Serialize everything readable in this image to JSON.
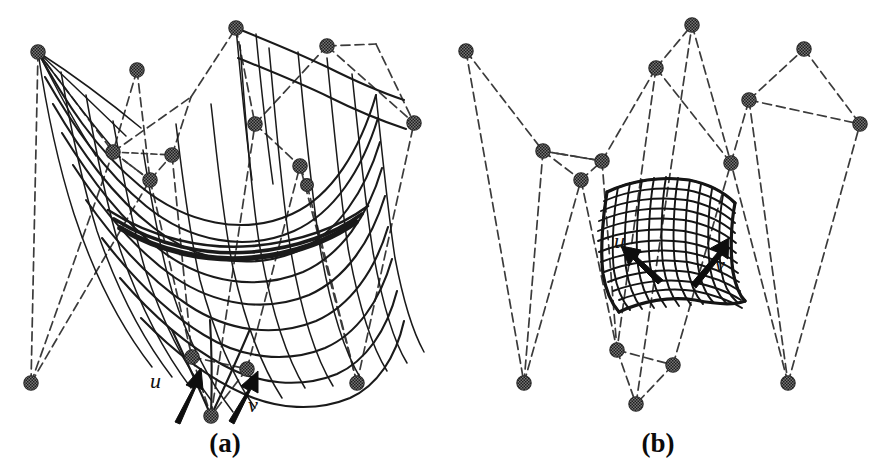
{
  "figure": {
    "kind": "scanned-figure",
    "background_color": "#ffffff",
    "ink_color": "#1a1a1a",
    "control_net_color": "#3b3b3b",
    "control_point_color": "#555555",
    "panels": [
      {
        "id": "a",
        "caption": "(a)",
        "caption_x": 225,
        "caption_y": 452,
        "description": "Large saddle-shaped subdivision surface with its dashed control net",
        "surface_kind": "dense-quad-wireframe-saddle",
        "u_label": "u",
        "v_label": "v",
        "u_label_x": 150,
        "u_label_y": 388,
        "v_label_x": 248,
        "v_label_y": 412,
        "u_arrow": {
          "x1": 175,
          "y1": 421,
          "x2": 196,
          "y2": 375
        },
        "v_arrow": {
          "x1": 229,
          "y1": 420,
          "x2": 253,
          "y2": 377
        },
        "control_points": [
          {
            "id": "cp-a-0",
            "x": 38,
            "y": 52
          },
          {
            "id": "cp-a-1",
            "x": 137,
            "y": 70
          },
          {
            "id": "cp-a-2",
            "x": 236,
            "y": 28
          },
          {
            "id": "cp-a-3",
            "x": 327,
            "y": 46
          },
          {
            "id": "cp-a-4",
            "x": 376,
            "y": 44
          },
          {
            "id": "cp-a-5",
            "x": 113,
            "y": 152
          },
          {
            "id": "cp-a-6",
            "x": 150,
            "y": 180
          },
          {
            "id": "cp-a-7",
            "x": 172,
            "y": 155
          },
          {
            "id": "cp-a-8",
            "x": 191,
            "y": 97
          },
          {
            "id": "cp-a-9",
            "x": 255,
            "y": 124
          },
          {
            "id": "cp-a-10",
            "x": 300,
            "y": 166
          },
          {
            "id": "cp-a-11",
            "x": 307,
            "y": 185
          },
          {
            "id": "cp-a-12",
            "x": 259,
            "y": 122
          },
          {
            "id": "cp-a-13",
            "x": 31,
            "y": 383
          },
          {
            "id": "cp-a-14",
            "x": 192,
            "y": 357
          },
          {
            "id": "cp-a-15",
            "x": 247,
            "y": 369
          },
          {
            "id": "cp-a-16",
            "x": 211,
            "y": 416
          },
          {
            "id": "cp-a-17",
            "x": 357,
            "y": 383
          }
        ]
      },
      {
        "id": "b",
        "caption": "(b)",
        "caption_x": 211,
        "caption_y": 452,
        "description": "Small subdivision surface patch with its dashed control net",
        "surface_kind": "dense-quad-wireframe-patch",
        "u_label": "u",
        "v_label": "v",
        "u_label_x": 167,
        "u_label_y": 248,
        "v_label_x": 268,
        "v_label_y": 272,
        "u_arrow": {
          "x1": 215,
          "y1": 278,
          "x2": 184,
          "y2": 250
        },
        "v_arrow": {
          "x1": 246,
          "y1": 281,
          "x2": 275,
          "y2": 244
        },
        "control_points": [
          {
            "id": "cp-b-0",
            "x": 19,
            "y": 51
          },
          {
            "id": "cp-b-1",
            "x": 96,
            "y": 151
          },
          {
            "id": "cp-b-2",
            "x": 134,
            "y": 180
          },
          {
            "id": "cp-b-3",
            "x": 155,
            "y": 161
          },
          {
            "id": "cp-b-4",
            "x": 209,
            "y": 68
          },
          {
            "id": "cp-b-5",
            "x": 245,
            "y": 25
          },
          {
            "id": "cp-b-6",
            "x": 302,
            "y": 100
          },
          {
            "id": "cp-b-7",
            "x": 284,
            "y": 163
          },
          {
            "id": "cp-b-8",
            "x": 357,
            "y": 49
          },
          {
            "id": "cp-b-9",
            "x": 413,
            "y": 124
          },
          {
            "id": "cp-b-10",
            "x": 77,
            "y": 383
          },
          {
            "id": "cp-b-11",
            "x": 170,
            "y": 350
          },
          {
            "id": "cp-b-12",
            "x": 226,
            "y": 365
          },
          {
            "id": "cp-b-13",
            "x": 189,
            "y": 404
          },
          {
            "id": "cp-b-14",
            "x": 341,
            "y": 383
          }
        ]
      }
    ]
  }
}
